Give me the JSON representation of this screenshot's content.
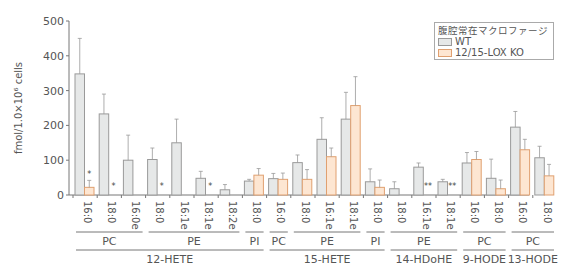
{
  "chart_data": {
    "type": "bar",
    "title": "",
    "xlabel": "",
    "ylabel": "fmol/1.0×10⁶ cells",
    "ylim": [
      0,
      500
    ],
    "yticks": [
      0,
      100,
      200,
      300,
      400,
      500
    ],
    "legend": {
      "title": "腹腔常在マクロファージ",
      "position": "top-right",
      "entries": [
        {
          "name": "WT",
          "color": "#e6e8e8",
          "edge": "#9a9a9a"
        },
        {
          "name": "12/15-LOX KO",
          "color": "#fde6d2",
          "edge": "#e0a070"
        }
      ]
    },
    "series_names": [
      "WT",
      "12/15-LOX KO"
    ],
    "groups": [
      {
        "lipid": "12-HETE",
        "classes": [
          {
            "name": "PC",
            "species": [
              {
                "label": "16:0",
                "WT": 348,
                "WT_err": 450,
                "KO": 22,
                "KO_err": 42,
                "sig": "*"
              },
              {
                "label": "18:0",
                "WT": 233,
                "WT_err": 290,
                "KO": 0,
                "KO_err": 0,
                "sig": "*"
              },
              {
                "label": "16:0e",
                "WT": 100,
                "WT_err": 172,
                "KO": null,
                "KO_err": null,
                "sig": ""
              }
            ]
          },
          {
            "name": "PE",
            "species": [
              {
                "label": "18:0",
                "WT": 102,
                "WT_err": 135,
                "KO": 0,
                "KO_err": 0,
                "sig": "*"
              },
              {
                "label": "16:1e",
                "WT": 150,
                "WT_err": 218,
                "KO": null,
                "KO_err": null,
                "sig": ""
              },
              {
                "label": "18:1e",
                "WT": 48,
                "WT_err": 68,
                "KO": 0,
                "KO_err": 0,
                "sig": "*"
              },
              {
                "label": "18:2e",
                "WT": 15,
                "WT_err": 30,
                "KO": null,
                "KO_err": null,
                "sig": ""
              }
            ]
          },
          {
            "name": "PI",
            "species": [
              {
                "label": "18:0",
                "WT": 40,
                "WT_err": 45,
                "KO": 57,
                "KO_err": 76,
                "sig": ""
              }
            ]
          }
        ]
      },
      {
        "lipid": "15-HETE",
        "classes": [
          {
            "name": "PC",
            "species": [
              {
                "label": "16:0",
                "WT": 47,
                "WT_err": 62,
                "KO": 45,
                "KO_err": 63,
                "sig": ""
              }
            ]
          },
          {
            "name": "PE",
            "species": [
              {
                "label": "18:0",
                "WT": 93,
                "WT_err": 115,
                "KO": 45,
                "KO_err": 73,
                "sig": ""
              },
              {
                "label": "16:1e",
                "WT": 160,
                "WT_err": 222,
                "KO": 110,
                "KO_err": 135,
                "sig": ""
              },
              {
                "label": "18:1e",
                "WT": 218,
                "WT_err": 295,
                "KO": 257,
                "KO_err": 340,
                "sig": ""
              }
            ]
          },
          {
            "name": "PI",
            "species": [
              {
                "label": "18:0",
                "WT": 38,
                "WT_err": 75,
                "KO": 22,
                "KO_err": 43,
                "sig": ""
              }
            ]
          }
        ]
      },
      {
        "lipid": "14-HDoHE",
        "classes": [
          {
            "name": "PE",
            "species": [
              {
                "label": "18:0",
                "WT": 18,
                "WT_err": 38,
                "KO": null,
                "KO_err": null,
                "sig": ""
              },
              {
                "label": "16:1e",
                "WT": 80,
                "WT_err": 92,
                "KO": 0,
                "KO_err": 0,
                "sig": "**"
              },
              {
                "label": "18:1e",
                "WT": 38,
                "WT_err": 45,
                "KO": 0,
                "KO_err": 0,
                "sig": "**"
              }
            ]
          }
        ]
      },
      {
        "lipid": "9-HODE",
        "classes": [
          {
            "name": "PC",
            "species": [
              {
                "label": "16:0",
                "WT": 92,
                "WT_err": 122,
                "KO": 102,
                "KO_err": 125,
                "sig": ""
              },
              {
                "label": "18:0",
                "WT": 48,
                "WT_err": 103,
                "KO": 18,
                "KO_err": 43,
                "sig": ""
              }
            ]
          }
        ]
      },
      {
        "lipid": "13-HODE",
        "classes": [
          {
            "name": "PC",
            "species": [
              {
                "label": "16:0",
                "WT": 195,
                "WT_err": 240,
                "KO": 130,
                "KO_err": 160,
                "sig": ""
              },
              {
                "label": "18:0",
                "WT": 107,
                "WT_err": 140,
                "KO": 55,
                "KO_err": 88,
                "sig": ""
              }
            ]
          }
        ]
      }
    ],
    "grid": false
  },
  "labels": {
    "ylabel": "fmol/1.0×10⁶ cells",
    "legend_title": "腹腔常在マクロファージ",
    "legend_wt": "WT",
    "legend_ko": "12/15-LOX KO"
  }
}
